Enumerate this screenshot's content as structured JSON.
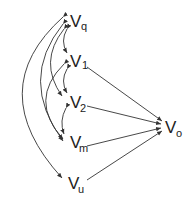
{
  "diagram": {
    "type": "path-diagram",
    "nodes": [
      {
        "id": "vq",
        "base": "V",
        "sub": "q",
        "x": 70,
        "y": 27
      },
      {
        "id": "v1",
        "base": "V",
        "sub": "1",
        "x": 70,
        "y": 67
      },
      {
        "id": "v2",
        "base": "V",
        "sub": "2",
        "x": 70,
        "y": 108
      },
      {
        "id": "vm",
        "base": "V",
        "sub": "m",
        "x": 70,
        "y": 148
      },
      {
        "id": "vu",
        "base": "V",
        "sub": "u",
        "x": 70,
        "y": 189
      },
      {
        "id": "vo",
        "base": "V",
        "sub": "o",
        "x": 166,
        "y": 133
      }
    ],
    "directed_edges": [
      {
        "from": "v1",
        "to": "vo"
      },
      {
        "from": "v2",
        "to": "vo"
      },
      {
        "from": "vm",
        "to": "vo"
      },
      {
        "from": "vu",
        "to": "vo"
      }
    ],
    "bidirectional_arcs": [
      {
        "a": "vq",
        "b": "v1"
      },
      {
        "a": "v1",
        "b": "v2"
      },
      {
        "a": "v2",
        "b": "vm"
      },
      {
        "a": "vq",
        "b": "v2"
      },
      {
        "a": "v1",
        "b": "vm"
      },
      {
        "a": "vq",
        "b": "vm"
      },
      {
        "a": "vq",
        "b": "vu"
      }
    ],
    "colors": {
      "ink": "#333333",
      "background": "#ffffff"
    }
  }
}
